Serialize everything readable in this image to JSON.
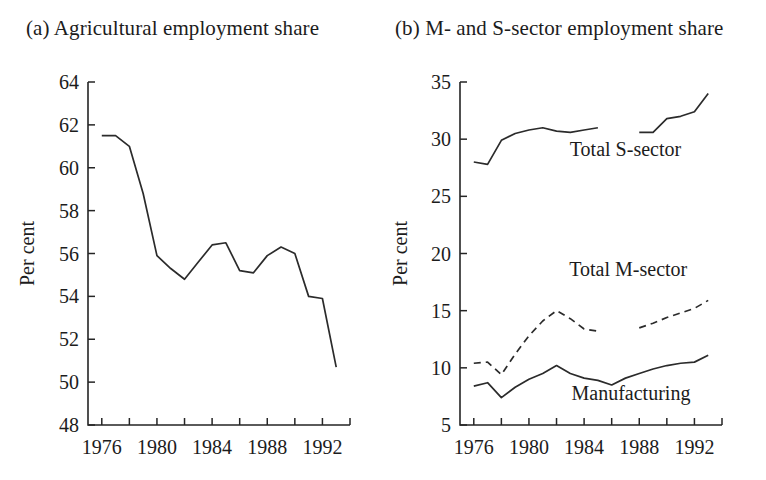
{
  "figure": {
    "panel_a": {
      "title": "(a) Agricultural employment share",
      "ylabel": "Per cent"
    },
    "panel_b": {
      "title": "(b) M- and S-sector employment share",
      "ylabel": "Per cent"
    }
  },
  "chart_data": [
    {
      "type": "line",
      "panel": "a",
      "title": "(a) Agricultural employment share",
      "xlabel": "",
      "ylabel": "Per cent",
      "xlim": [
        1975,
        1994
      ],
      "ylim": [
        48,
        64
      ],
      "ytick_values": [
        48,
        50,
        52,
        54,
        56,
        58,
        60,
        62,
        64
      ],
      "ytick_labels": [
        "48",
        "50",
        "52",
        "54",
        "56",
        "58",
        "60",
        "62",
        "64"
      ],
      "xtick_values": [
        1976,
        1978,
        1980,
        1982,
        1984,
        1986,
        1988,
        1990,
        1992,
        1994
      ],
      "xtick_labels": [
        "1976",
        "",
        "1980",
        "",
        "1984",
        "",
        "1988",
        "",
        "1992",
        ""
      ],
      "grid": false,
      "legend": "none",
      "series": [
        {
          "name": "Agricultural employment share",
          "style": "solid",
          "x": [
            1976,
            1977,
            1978,
            1979,
            1980,
            1981,
            1982,
            1983,
            1984,
            1985,
            1986,
            1987,
            1988,
            1989,
            1990,
            1991,
            1992,
            1993
          ],
          "values": [
            61.5,
            61.5,
            61.0,
            58.8,
            55.9,
            55.3,
            54.8,
            55.6,
            56.4,
            56.5,
            55.2,
            55.1,
            55.9,
            56.3,
            56.0,
            54.0,
            53.9,
            50.7
          ]
        }
      ]
    },
    {
      "type": "line",
      "panel": "b",
      "title": "(b) M- and S-sector employment share",
      "xlabel": "",
      "ylabel": "Per cent",
      "xlim": [
        1975,
        1994
      ],
      "ylim": [
        5,
        35
      ],
      "ytick_values": [
        5,
        10,
        15,
        20,
        25,
        30,
        35
      ],
      "ytick_labels": [
        "5",
        "10",
        "15",
        "20",
        "25",
        "30",
        "35"
      ],
      "xtick_values": [
        1976,
        1978,
        1980,
        1982,
        1984,
        1986,
        1988,
        1990,
        1992,
        1994
      ],
      "xtick_labels": [
        "1976",
        "",
        "1980",
        "",
        "1984",
        "",
        "1988",
        "",
        "1992",
        ""
      ],
      "grid": false,
      "legend": "inline-annotations",
      "series": [
        {
          "name": "Total S-sector",
          "style": "solid",
          "segments": [
            {
              "x": [
                1976,
                1977,
                1978,
                1979,
                1980,
                1981,
                1982,
                1983,
                1984,
                1985
              ],
              "values": [
                28.0,
                27.8,
                29.9,
                30.5,
                30.8,
                31.0,
                30.7,
                30.6,
                30.8,
                31.0
              ]
            },
            {
              "x": [
                1988,
                1989,
                1990,
                1991,
                1992,
                1993
              ],
              "values": [
                30.6,
                30.6,
                31.8,
                32.0,
                32.4,
                34.0
              ]
            }
          ],
          "label": "Total S-sector"
        },
        {
          "name": "Total M-sector",
          "style": "dashed",
          "segments": [
            {
              "x": [
                1976,
                1977,
                1978,
                1979,
                1980,
                1981,
                1982,
                1983,
                1984,
                1985
              ],
              "values": [
                10.4,
                10.5,
                9.4,
                11.2,
                12.8,
                14.1,
                15.0,
                14.3,
                13.4,
                13.2
              ]
            },
            {
              "x": [
                1988,
                1989,
                1990,
                1991,
                1992,
                1993
              ],
              "values": [
                13.5,
                13.9,
                14.4,
                14.8,
                15.2,
                15.9
              ]
            }
          ],
          "label": "Total M-sector"
        },
        {
          "name": "Manufacturing",
          "style": "solid",
          "segments": [
            {
              "x": [
                1976,
                1977,
                1978,
                1979,
                1980,
                1981,
                1982,
                1983,
                1984,
                1985,
                1986,
                1987,
                1988,
                1989,
                1990,
                1991,
                1992,
                1993
              ],
              "values": [
                8.4,
                8.7,
                7.4,
                8.3,
                9.0,
                9.5,
                10.2,
                9.5,
                9.1,
                8.9,
                8.5,
                9.1,
                9.5,
                9.9,
                10.2,
                10.4,
                10.5,
                11.1
              ]
            }
          ],
          "label": "Manufacturing"
        }
      ],
      "annotations": [
        {
          "text": "Total S-sector",
          "x": 1987.0,
          "y": 28.5
        },
        {
          "text": "Total M-sector",
          "x": 1987.2,
          "y": 18.0
        },
        {
          "text": "Manufacturing",
          "x": 1987.4,
          "y": 7.2
        }
      ]
    }
  ]
}
